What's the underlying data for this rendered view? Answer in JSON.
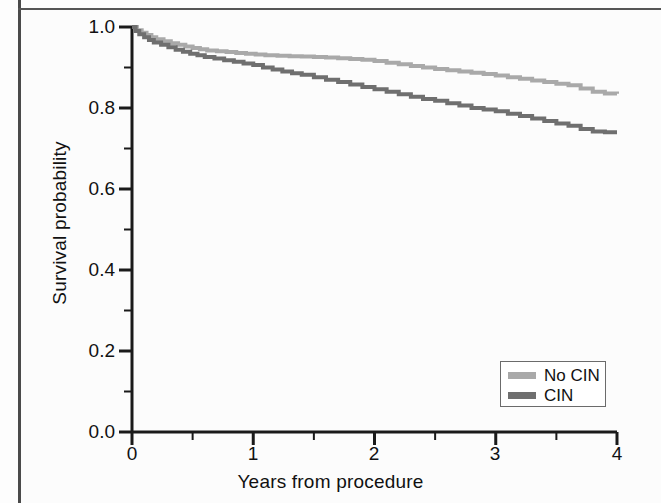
{
  "chart_data": {
    "type": "line",
    "subtype": "kaplan-meier-step",
    "title": "",
    "xlabel": "Years from procedure",
    "ylabel": "Survival probability",
    "xlim": [
      0,
      4
    ],
    "ylim": [
      0,
      1
    ],
    "grid": false,
    "legend_position": "bottom-right",
    "x_ticks": [
      0,
      1,
      2,
      3,
      4
    ],
    "x_tick_labels": [
      "0",
      "1",
      "2",
      "3",
      "4"
    ],
    "x_minor_ticks": [
      0.5,
      1.5,
      2.5,
      3.5
    ],
    "y_ticks": [
      0.0,
      0.2,
      0.4,
      0.6,
      0.8,
      1.0
    ],
    "y_tick_labels": [
      "0.0",
      "0.2",
      "0.4",
      "0.6",
      "0.8",
      "1.0"
    ],
    "y_minor_ticks": [
      0.1,
      0.3,
      0.5,
      0.7,
      0.9
    ],
    "colors": {
      "no_cin": "#a9a9a9",
      "cin": "#6f6f6f",
      "axis": "#1a1a1a",
      "frame": "#4a4a4a"
    },
    "series": [
      {
        "name": "No CIN",
        "color": "#a9a9a9",
        "final_value": 0.835,
        "points": [
          [
            0.0,
            1.0
          ],
          [
            0.04,
            0.992
          ],
          [
            0.08,
            0.986
          ],
          [
            0.12,
            0.98
          ],
          [
            0.16,
            0.975
          ],
          [
            0.2,
            0.97
          ],
          [
            0.26,
            0.965
          ],
          [
            0.32,
            0.96
          ],
          [
            0.38,
            0.956
          ],
          [
            0.44,
            0.952
          ],
          [
            0.5,
            0.948
          ],
          [
            0.56,
            0.945
          ],
          [
            0.62,
            0.942
          ],
          [
            0.7,
            0.94
          ],
          [
            0.78,
            0.938
          ],
          [
            0.86,
            0.936
          ],
          [
            0.94,
            0.934
          ],
          [
            1.02,
            0.932
          ],
          [
            1.1,
            0.93
          ],
          [
            1.2,
            0.929
          ],
          [
            1.3,
            0.928
          ],
          [
            1.4,
            0.927
          ],
          [
            1.5,
            0.926
          ],
          [
            1.6,
            0.925
          ],
          [
            1.7,
            0.923
          ],
          [
            1.8,
            0.921
          ],
          [
            1.9,
            0.919
          ],
          [
            2.0,
            0.916
          ],
          [
            2.1,
            0.912
          ],
          [
            2.2,
            0.908
          ],
          [
            2.3,
            0.904
          ],
          [
            2.4,
            0.9
          ],
          [
            2.5,
            0.896
          ],
          [
            2.6,
            0.893
          ],
          [
            2.7,
            0.89
          ],
          [
            2.8,
            0.887
          ],
          [
            2.9,
            0.884
          ],
          [
            3.0,
            0.88
          ],
          [
            3.1,
            0.876
          ],
          [
            3.2,
            0.872
          ],
          [
            3.3,
            0.868
          ],
          [
            3.4,
            0.864
          ],
          [
            3.5,
            0.86
          ],
          [
            3.6,
            0.856
          ],
          [
            3.7,
            0.848
          ],
          [
            3.8,
            0.84
          ],
          [
            3.9,
            0.836
          ],
          [
            4.0,
            0.835
          ]
        ]
      },
      {
        "name": "CIN",
        "color": "#6f6f6f",
        "final_value": 0.74,
        "points": [
          [
            0.0,
            1.0
          ],
          [
            0.03,
            0.99
          ],
          [
            0.06,
            0.982
          ],
          [
            0.1,
            0.975
          ],
          [
            0.14,
            0.968
          ],
          [
            0.18,
            0.962
          ],
          [
            0.24,
            0.956
          ],
          [
            0.3,
            0.95
          ],
          [
            0.36,
            0.944
          ],
          [
            0.42,
            0.939
          ],
          [
            0.48,
            0.934
          ],
          [
            0.54,
            0.93
          ],
          [
            0.6,
            0.926
          ],
          [
            0.68,
            0.922
          ],
          [
            0.76,
            0.918
          ],
          [
            0.84,
            0.914
          ],
          [
            0.92,
            0.91
          ],
          [
            1.0,
            0.906
          ],
          [
            1.08,
            0.9
          ],
          [
            1.16,
            0.895
          ],
          [
            1.24,
            0.89
          ],
          [
            1.32,
            0.886
          ],
          [
            1.4,
            0.882
          ],
          [
            1.5,
            0.876
          ],
          [
            1.6,
            0.87
          ],
          [
            1.7,
            0.864
          ],
          [
            1.8,
            0.858
          ],
          [
            1.9,
            0.852
          ],
          [
            2.0,
            0.846
          ],
          [
            2.1,
            0.84
          ],
          [
            2.2,
            0.834
          ],
          [
            2.3,
            0.828
          ],
          [
            2.4,
            0.822
          ],
          [
            2.5,
            0.818
          ],
          [
            2.6,
            0.812
          ],
          [
            2.7,
            0.806
          ],
          [
            2.8,
            0.8
          ],
          [
            2.9,
            0.796
          ],
          [
            3.0,
            0.792
          ],
          [
            3.1,
            0.786
          ],
          [
            3.2,
            0.78
          ],
          [
            3.3,
            0.774
          ],
          [
            3.4,
            0.768
          ],
          [
            3.5,
            0.762
          ],
          [
            3.6,
            0.756
          ],
          [
            3.7,
            0.748
          ],
          [
            3.8,
            0.742
          ],
          [
            3.9,
            0.74
          ],
          [
            4.0,
            0.74
          ]
        ]
      }
    ]
  },
  "legend": {
    "items": [
      {
        "label": "No CIN",
        "color": "#a9a9a9"
      },
      {
        "label": "CIN",
        "color": "#6f6f6f"
      }
    ]
  }
}
